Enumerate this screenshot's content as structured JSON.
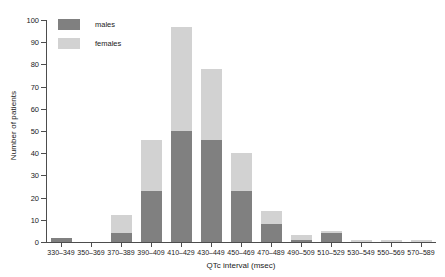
{
  "chart_data": {
    "type": "bar",
    "subtype": "stacked-histogram",
    "title": "",
    "xlabel": "QTc interval (msec)",
    "ylabel": "Number of patients",
    "categories": [
      "330–349",
      "350–369",
      "370–389",
      "390–409",
      "410–429",
      "430–449",
      "450–469",
      "470–489",
      "490–509",
      "510–529",
      "530–549",
      "550–569",
      "570–589"
    ],
    "series": [
      {
        "name": "males",
        "color": "#808080",
        "values": [
          2,
          0,
          4,
          23,
          50,
          46,
          23,
          8,
          1,
          4,
          0,
          0,
          0
        ]
      },
      {
        "name": "females",
        "color": "#d2d2d2",
        "values": [
          0,
          0,
          8,
          23,
          47,
          32,
          17,
          6,
          2,
          1,
          1,
          1,
          1
        ]
      }
    ],
    "totals": [
      2,
      0,
      12,
      46,
      97,
      78,
      40,
      14,
      3,
      5,
      1,
      1,
      1
    ],
    "ylim": [
      0,
      100
    ],
    "yticks": [
      0,
      10,
      20,
      30,
      40,
      50,
      60,
      70,
      80,
      90,
      100
    ],
    "ytick_labels": [
      "0",
      "10",
      "20",
      "30",
      "40",
      "50",
      "60",
      "70",
      "80",
      "90",
      "100"
    ],
    "grid": false,
    "legend_position": "top-left",
    "legend": [
      "males",
      "females"
    ]
  },
  "axis": {
    "x_title": "QTc interval (msec)",
    "y_title": "Number of patients"
  },
  "colors": {
    "males": "#808080",
    "females": "#d2d2d2",
    "axis": "#4d4d4d",
    "text": "#1a1a1a",
    "background": "#ffffff"
  }
}
